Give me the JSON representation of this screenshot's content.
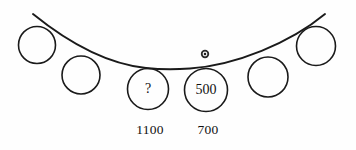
{
  "figure": {
    "background_color": "#fefefe",
    "ink_color": "#1a1a1a",
    "width": 356,
    "height": 150
  },
  "curve": {
    "name": "sagging-cable-curve",
    "description": "Downward sagging curve spanning the figure",
    "path": "M 33 14 C 70 44 108 64 146 68 C 160 69.5 176 69.5 190 68.5 C 236 65 290 43 325 14",
    "stroke_width": 1.9
  },
  "marker": {
    "name": "curve-point-marker",
    "cx": 205,
    "cy": 54,
    "r_outer": 4.2,
    "r_mid": 2.4,
    "r_inner": 1.2
  },
  "circles": [
    {
      "id": "circle-1",
      "label": "",
      "cx": 37,
      "cy": 45,
      "r": 18.5
    },
    {
      "id": "circle-2",
      "label": "",
      "cx": 81,
      "cy": 75,
      "r": 19.0
    },
    {
      "id": "circle-3",
      "label": "?",
      "cx": 148,
      "cy": 89,
      "r": 20.5
    },
    {
      "id": "circle-4",
      "label": "500",
      "cx": 206,
      "cy": 90,
      "r": 21.5
    },
    {
      "id": "circle-5",
      "label": "",
      "cx": 268,
      "cy": 77,
      "r": 20.0
    },
    {
      "id": "circle-6",
      "label": "",
      "cx": 316,
      "cy": 46,
      "r": 19.5
    }
  ],
  "labels": [
    {
      "id": "label-left",
      "text": "1100",
      "x": 150,
      "y": 131
    },
    {
      "id": "label-right",
      "text": "700",
      "x": 208,
      "y": 131
    }
  ]
}
